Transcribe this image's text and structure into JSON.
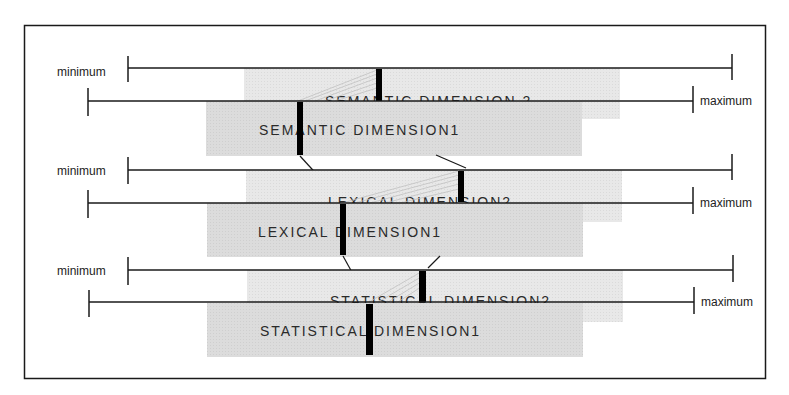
{
  "labels": {
    "minimum": "minimum",
    "maximum": "maximum"
  },
  "colors": {
    "frame": "#1a1a1a",
    "box_back": "#e4e4e4",
    "box_front": "#d6d6d6",
    "box_border": "#c8c8c8",
    "marker": "#000000",
    "axis": "#1a1a1a",
    "connector": "#1a1a1a",
    "hatch": "#bdbdbd"
  },
  "rows": [
    {
      "name": "semantic",
      "dimension1_label": "SEMANTIC DIMENSION1",
      "dimension2_label": "SEMANTIC DIMENSION  2"
    },
    {
      "name": "lexical",
      "dimension1_label": "LEXICAL DIMENSION1",
      "dimension2_label": "LEXICAL DIMENSION2"
    },
    {
      "name": "statistical",
      "dimension1_label": "STATISTICAL DIMENSION1",
      "dimension2_label": "STATISTICAL DIMENSION2"
    }
  ]
}
